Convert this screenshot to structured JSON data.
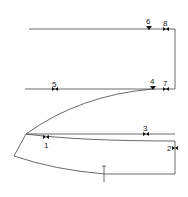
{
  "diagram": {
    "type": "sewing-pattern-seam-marks",
    "colors": {
      "line": "#444444",
      "marker": "#111111",
      "label": "#222222",
      "background": "#ffffff"
    },
    "markers": [
      {
        "id": "1",
        "label": "1",
        "kind": "bowtie",
        "x": 46,
        "y": 137,
        "label_x": 44,
        "label_y": 148
      },
      {
        "id": "2",
        "label": "2",
        "kind": "bowtie",
        "x": 174,
        "y": 148,
        "label_x": 167,
        "label_y": 151
      },
      {
        "id": "3",
        "label": "3",
        "kind": "bowtie",
        "x": 146,
        "y": 134,
        "label_x": 143,
        "label_y": 131
      },
      {
        "id": "4",
        "label": "4",
        "kind": "triangle",
        "x": 153,
        "y": 89,
        "label_x": 150,
        "label_y": 85
      },
      {
        "id": "5",
        "label": "5",
        "kind": "bowtie",
        "x": 55,
        "y": 89,
        "label_x": 52,
        "label_y": 88
      },
      {
        "id": "6",
        "label": "6",
        "kind": "triangle",
        "x": 149,
        "y": 29,
        "label_x": 146,
        "label_y": 24
      },
      {
        "id": "7",
        "label": "7",
        "kind": "bowtie",
        "x": 166,
        "y": 89,
        "label_x": 163,
        "label_y": 88
      },
      {
        "id": "8",
        "label": "8",
        "kind": "bowtie",
        "x": 166,
        "y": 29,
        "label_x": 163,
        "label_y": 27
      }
    ]
  }
}
